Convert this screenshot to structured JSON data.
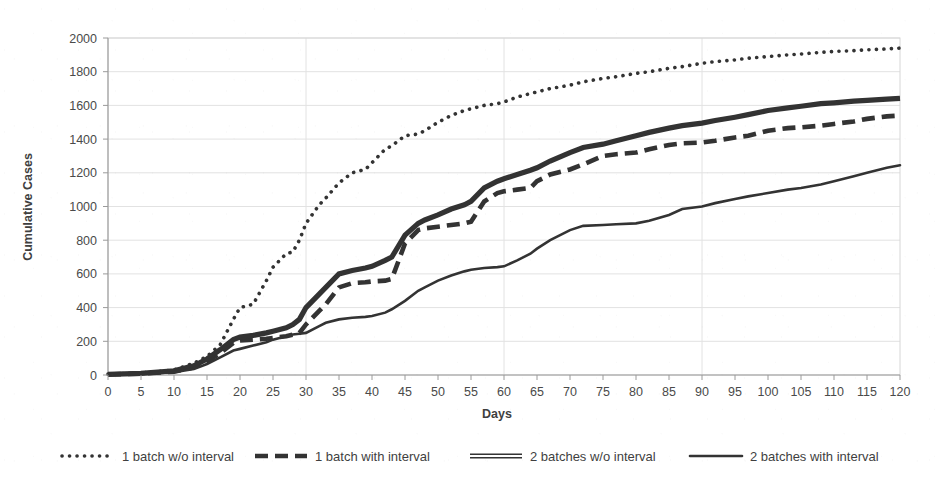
{
  "chart_data": {
    "type": "line",
    "title": "",
    "xlabel": "Days",
    "ylabel": "Cumulative Cases",
    "xlim": [
      0,
      120
    ],
    "ylim": [
      0,
      2000
    ],
    "xticks": [
      0,
      5,
      10,
      15,
      20,
      25,
      30,
      35,
      40,
      45,
      50,
      55,
      60,
      65,
      70,
      75,
      80,
      85,
      90,
      95,
      100,
      105,
      110,
      115,
      120
    ],
    "yticks": [
      0,
      200,
      400,
      600,
      800,
      1000,
      1200,
      1400,
      1600,
      1800,
      2000
    ],
    "grid": true,
    "legend_position": "bottom",
    "x": [
      0,
      5,
      10,
      13,
      15,
      17,
      19,
      20,
      22,
      24,
      25,
      27,
      28,
      29,
      30,
      32,
      33,
      35,
      37,
      39,
      40,
      42,
      43,
      45,
      47,
      48,
      50,
      52,
      54,
      55,
      57,
      59,
      60,
      62,
      64,
      65,
      67,
      70,
      72,
      75,
      77,
      80,
      82,
      85,
      87,
      90,
      92,
      95,
      97,
      100,
      103,
      105,
      108,
      110,
      113,
      115,
      118,
      120
    ],
    "series": [
      {
        "name": "1 batch w/o interval",
        "style": "dotted",
        "values": [
          5,
          12,
          30,
          70,
          110,
          180,
          330,
          400,
          420,
          560,
          640,
          720,
          730,
          800,
          900,
          1010,
          1050,
          1140,
          1200,
          1220,
          1260,
          1340,
          1360,
          1420,
          1430,
          1450,
          1500,
          1540,
          1570,
          1580,
          1600,
          1610,
          1620,
          1650,
          1670,
          1680,
          1700,
          1720,
          1740,
          1760,
          1770,
          1790,
          1800,
          1820,
          1830,
          1850,
          1860,
          1870,
          1880,
          1890,
          1900,
          1905,
          1915,
          1920,
          1925,
          1930,
          1935,
          1940
        ]
      },
      {
        "name": "1 batch with interval",
        "style": "dashed",
        "values": [
          3,
          8,
          20,
          45,
          80,
          130,
          190,
          205,
          210,
          215,
          220,
          230,
          240,
          250,
          300,
          380,
          420,
          520,
          545,
          550,
          555,
          560,
          570,
          780,
          860,
          870,
          880,
          890,
          900,
          910,
          1030,
          1080,
          1090,
          1100,
          1110,
          1150,
          1190,
          1220,
          1250,
          1300,
          1310,
          1320,
          1340,
          1365,
          1375,
          1380,
          1390,
          1410,
          1420,
          1450,
          1465,
          1470,
          1480,
          1490,
          1505,
          1520,
          1535,
          1540
        ]
      },
      {
        "name": "2 batches w/o interval",
        "style": "double",
        "values": [
          4,
          10,
          25,
          55,
          95,
          150,
          210,
          225,
          235,
          250,
          260,
          280,
          300,
          330,
          400,
          480,
          520,
          600,
          620,
          635,
          645,
          680,
          700,
          830,
          900,
          920,
          950,
          985,
          1010,
          1030,
          1110,
          1150,
          1165,
          1190,
          1215,
          1230,
          1270,
          1320,
          1350,
          1370,
          1390,
          1420,
          1440,
          1465,
          1480,
          1495,
          1510,
          1530,
          1545,
          1570,
          1585,
          1595,
          1610,
          1615,
          1625,
          1630,
          1637,
          1642
        ]
      },
      {
        "name": "2 batches with interval",
        "style": "solid",
        "values": [
          2,
          6,
          16,
          35,
          65,
          105,
          145,
          155,
          175,
          195,
          210,
          230,
          240,
          245,
          250,
          290,
          310,
          330,
          340,
          345,
          350,
          370,
          390,
          440,
          500,
          520,
          560,
          590,
          615,
          625,
          635,
          640,
          645,
          680,
          720,
          750,
          800,
          860,
          885,
          890,
          895,
          900,
          915,
          950,
          985,
          1000,
          1020,
          1045,
          1060,
          1080,
          1100,
          1110,
          1130,
          1150,
          1180,
          1200,
          1230,
          1245
        ]
      }
    ]
  },
  "legend": {
    "items": [
      {
        "label": "1 batch w/o interval",
        "style": "dotted"
      },
      {
        "label": "1 batch with interval",
        "style": "dashed"
      },
      {
        "label": "2 batches w/o interval",
        "style": "double"
      },
      {
        "label": "2 batches with interval",
        "style": "solid"
      }
    ]
  },
  "axes": {
    "x_title": "Days",
    "y_title": "Cumulative Cases"
  }
}
